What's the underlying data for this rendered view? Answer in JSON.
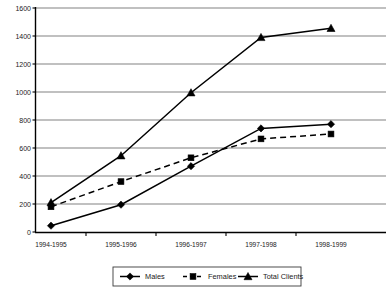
{
  "chart_data": {
    "type": "line",
    "title": "",
    "subtitle": "",
    "xlabel": "",
    "ylabel": "",
    "categories": [
      "1994-1995",
      "1995-1996",
      "1996-1997",
      "1997-1998",
      "1998-1999"
    ],
    "series": [
      {
        "name": "Males",
        "marker": "diamond",
        "linestyle": "solid",
        "color": "#000000",
        "values": [
          45,
          195,
          470,
          740,
          770
        ]
      },
      {
        "name": "Females",
        "marker": "square",
        "linestyle": "dashed",
        "color": "#000000",
        "values": [
          180,
          360,
          530,
          665,
          700
        ]
      },
      {
        "name": "Total Clients",
        "marker": "triangle",
        "linestyle": "solid",
        "color": "#000000",
        "values": [
          210,
          545,
          995,
          1390,
          1455
        ]
      }
    ],
    "ylim": [
      0,
      1600
    ],
    "ytick_step": 200,
    "yticks": [
      "0",
      "200",
      "400",
      "600",
      "800",
      "1000",
      "1200",
      "1400",
      "1600"
    ],
    "grid": true,
    "grid_axis": "y",
    "legend_position": "bottom",
    "legend_entries": [
      "Males",
      "Females",
      "Total Clients"
    ],
    "background_color": "#ffffff",
    "axis_color": "#000000"
  }
}
